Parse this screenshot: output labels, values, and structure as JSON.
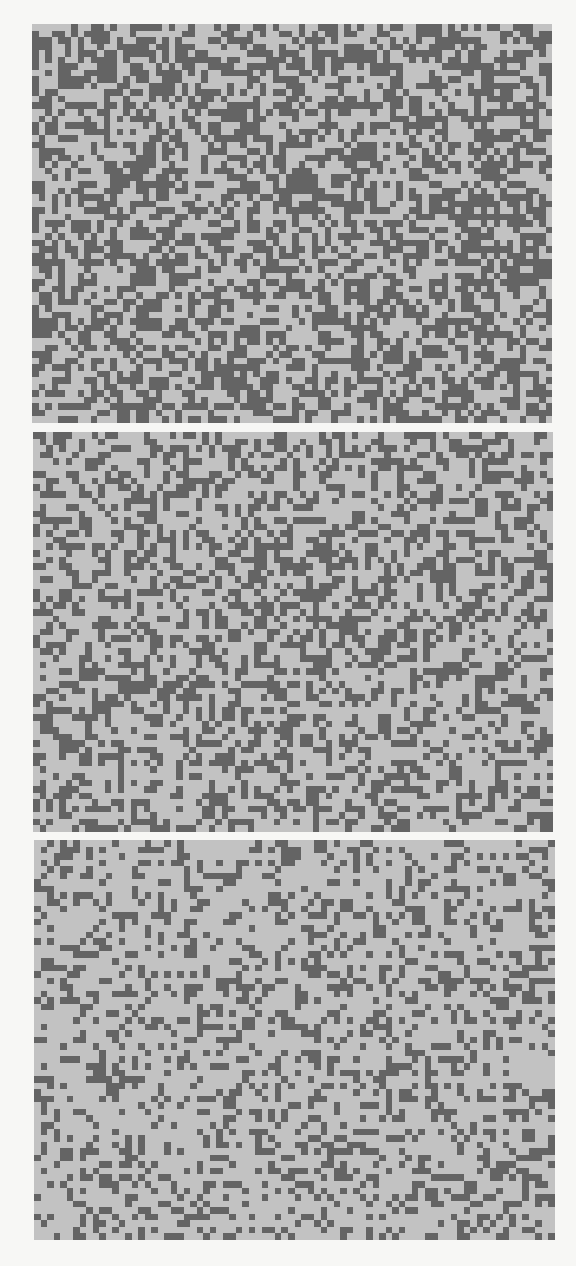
{
  "figure": {
    "colors": {
      "background": "#f7f7f5",
      "light_cell": "#c2c2c2",
      "dark_cell": "#646464"
    },
    "panels": [
      {
        "id": "top",
        "x": 32,
        "y": 24,
        "width": 520,
        "height": 399,
        "cols": 80,
        "rows": 61,
        "dark_density": 0.5,
        "seed": 11
      },
      {
        "id": "middle",
        "x": 33,
        "y": 432,
        "width": 520,
        "height": 400,
        "cols": 80,
        "rows": 61,
        "dark_density": 0.4,
        "seed": 23
      },
      {
        "id": "bottom",
        "x": 34,
        "y": 840,
        "width": 521,
        "height": 400,
        "cols": 80,
        "rows": 61,
        "dark_density": 0.3,
        "seed": 37
      }
    ]
  }
}
